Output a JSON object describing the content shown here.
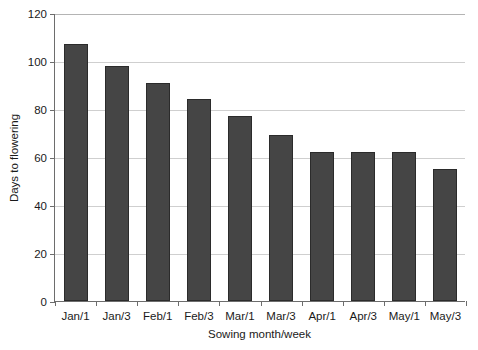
{
  "chart_data": {
    "type": "bar",
    "title": "",
    "xlabel": "Sowing month/week",
    "ylabel": "Days to flowering",
    "categories": [
      "Jan/1",
      "Jan/3",
      "Feb/1",
      "Feb/3",
      "Mar/1",
      "Mar/3",
      "Apr/1",
      "Apr/3",
      "May/1",
      "May/3"
    ],
    "values": [
      107,
      98,
      91,
      84,
      77,
      69,
      62,
      62,
      62,
      55
    ],
    "series": [
      {
        "name": "Days to flowering",
        "values": [
          107,
          98,
          91,
          84,
          77,
          69,
          62,
          62,
          62,
          55
        ]
      }
    ],
    "ylim": [
      0,
      120
    ],
    "yticks": [
      0,
      20,
      40,
      60,
      80,
      100,
      120
    ],
    "ytick_labels": [
      "0",
      "20",
      "40",
      "60",
      "80",
      "100",
      "120"
    ],
    "grid": "horizontal",
    "legend": "none",
    "bar_color": "#454545",
    "bar_edge_color": "#2b2b2b",
    "grid_color": "#cfcfcf",
    "axis_color": "#6d6d6d",
    "background": "#ffffff"
  }
}
